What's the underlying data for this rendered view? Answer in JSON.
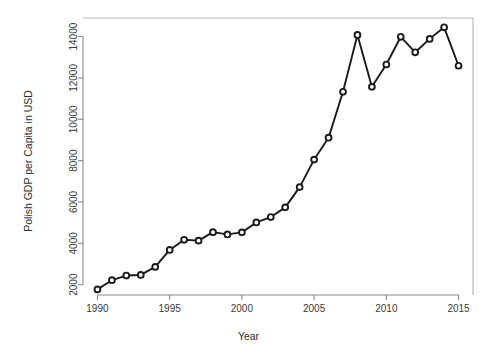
{
  "chart_data": {
    "type": "line",
    "title": "",
    "xlabel": "Year",
    "ylabel": "Polish GDP per Capita in USD",
    "xlim": [
      1989.0,
      2016.0
    ],
    "ylim": [
      1500,
      14900
    ],
    "grid": false,
    "legend": "none",
    "marker": "open-circle",
    "line_style": "solid",
    "x_ticks": [
      1990,
      1995,
      2000,
      2005,
      2010,
      2015
    ],
    "x_tick_labels": [
      "1990",
      "1995",
      "2000",
      "2005",
      "2010",
      "2015"
    ],
    "y_ticks": [
      2000,
      4000,
      6000,
      8000,
      10000,
      12000,
      14000
    ],
    "y_tick_labels": [
      "2000",
      "4000",
      "6000",
      "8000",
      "10000",
      "12000",
      "14000"
    ],
    "x": [
      1990,
      1991,
      1992,
      1993,
      1994,
      1995,
      1996,
      1997,
      1998,
      1999,
      2000,
      2001,
      2002,
      2003,
      2004,
      2005,
      2006,
      2007,
      2008,
      2009,
      2010,
      2011,
      2012,
      2013,
      2014,
      2015
    ],
    "values": [
      1770,
      2215,
      2440,
      2470,
      2860,
      3680,
      4170,
      4130,
      4540,
      4430,
      4530,
      5010,
      5270,
      5740,
      6720,
      8050,
      9110,
      11330,
      14080,
      11570,
      12650,
      13990,
      13240,
      13890,
      14450,
      12590
    ],
    "series": [
      {
        "name": "Polish GDP per Capita in USD",
        "color": "#1a1a1a",
        "values": [
          1770,
          2215,
          2440,
          2470,
          2860,
          3680,
          4170,
          4130,
          4540,
          4430,
          4530,
          5010,
          5270,
          5740,
          6720,
          8050,
          9110,
          11330,
          14080,
          11570,
          12650,
          13990,
          13240,
          13890,
          14450,
          12590
        ]
      }
    ]
  },
  "axes": {
    "x_title": "Year",
    "y_title": "Polish GDP per Capita in USD"
  },
  "colors": {
    "series": "#1a1a1a",
    "axis": "#8a8a8a",
    "frame": "#b5b5b5",
    "text": "#3a3a3a",
    "background": "#ffffff"
  }
}
